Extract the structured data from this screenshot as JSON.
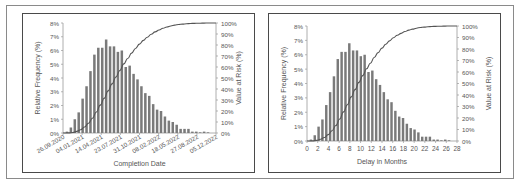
{
  "chart_data": [
    {
      "type": "bar",
      "title": "",
      "xlabel": "Completion Date",
      "ylabel": "Relative Frequency (%)",
      "y2label": "Value at Risk (%)",
      "ylim": [
        0,
        8
      ],
      "y2lim": [
        0,
        100
      ],
      "yticks": [
        "0%",
        "1%",
        "2%",
        "3%",
        "4%",
        "5%",
        "6%",
        "7%",
        "8%"
      ],
      "y2ticks": [
        "0%",
        "10%",
        "20%",
        "30%",
        "40%",
        "50%",
        "60%",
        "70%",
        "80%",
        "90%",
        "100%"
      ],
      "xticks": [
        "26.09.2020",
        "04.01.2021",
        "14.04.2021",
        "23.07.2021",
        "31.10.2021",
        "08.02.2022",
        "18.05.2022",
        "27.08.2022",
        "05.12.2022"
      ],
      "grid": false,
      "legend": "none",
      "series": [
        {
          "name": "Relative Frequency",
          "type": "bar",
          "values": [
            0.1,
            0.4,
            1.0,
            1.5,
            2.5,
            3.4,
            4.5,
            5.7,
            6.2,
            6.2,
            6.8,
            6.3,
            6.3,
            5.9,
            6.0,
            4.8,
            4.9,
            4.3,
            3.9,
            3.4,
            2.9,
            2.7,
            2.1,
            1.7,
            1.6,
            1.2,
            0.9,
            0.8,
            0.6,
            0.3,
            0.3,
            0.3,
            0.1,
            0.1,
            0.05,
            0.1,
            0.05
          ]
        },
        {
          "name": "Value at Risk (cumulative)",
          "type": "line",
          "axis": "y2",
          "description": "S-shaped cumulative curve rising from 0% to 100%"
        }
      ]
    },
    {
      "type": "bar",
      "title": "",
      "xlabel": "Delay in Months",
      "ylabel": "Relative Frequency (%)",
      "y2label": "Value at Risk (%)",
      "ylim": [
        0,
        8
      ],
      "y2lim": [
        0,
        100
      ],
      "xlim": [
        0,
        28
      ],
      "yticks": [
        "0%",
        "1%",
        "2%",
        "3%",
        "4%",
        "5%",
        "6%",
        "7%",
        "8%"
      ],
      "y2ticks": [
        "0%",
        "10%",
        "20%",
        "30%",
        "40%",
        "50%",
        "60%",
        "70%",
        "80%",
        "90%",
        "100%"
      ],
      "xticks": [
        "0",
        "2",
        "4",
        "6",
        "8",
        "10",
        "12",
        "14",
        "16",
        "18",
        "20",
        "22",
        "24",
        "26",
        "28"
      ],
      "grid": false,
      "legend": "none",
      "series": [
        {
          "name": "Relative Frequency",
          "type": "bar",
          "values": [
            0.1,
            0.4,
            1.0,
            1.5,
            2.5,
            3.4,
            4.5,
            5.7,
            6.2,
            6.2,
            6.8,
            6.3,
            6.3,
            5.9,
            6.0,
            4.8,
            4.9,
            4.3,
            3.9,
            3.4,
            2.9,
            2.7,
            2.1,
            1.7,
            1.6,
            1.2,
            0.9,
            0.8,
            0.6,
            0.3,
            0.3,
            0.3,
            0.1,
            0.1,
            0.05,
            0.1,
            0.05
          ]
        },
        {
          "name": "Value at Risk (cumulative)",
          "type": "line",
          "axis": "y2",
          "description": "S-shaped cumulative curve rising from 0% to 100%"
        }
      ]
    }
  ]
}
